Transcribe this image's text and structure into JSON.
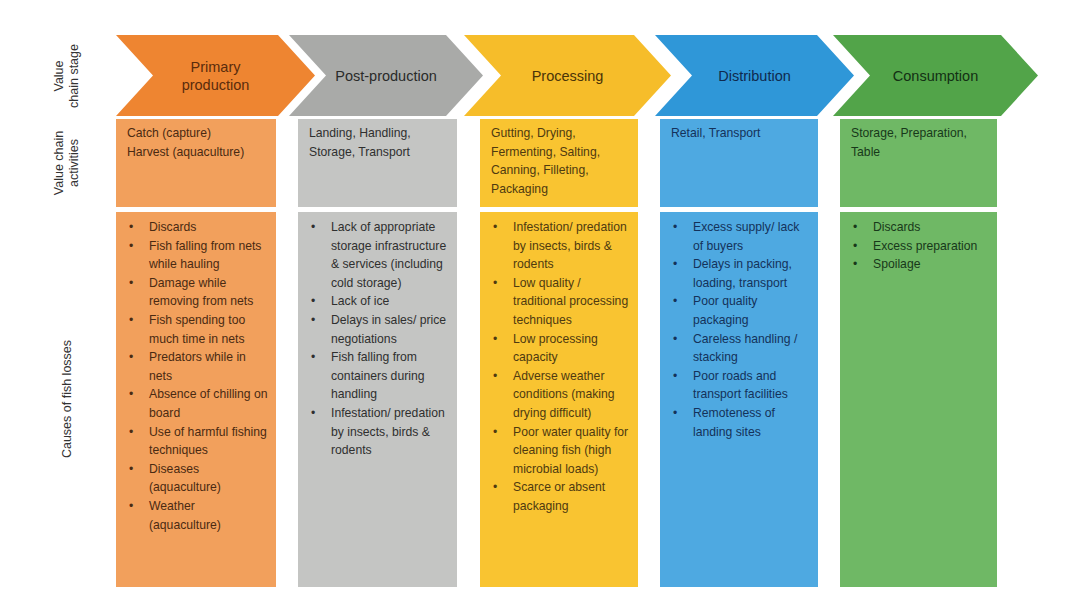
{
  "row_labels": {
    "stage": [
      "Value",
      "chain stage"
    ],
    "activities": [
      "Value chain",
      "activities"
    ],
    "causes": "Causes of fish losses"
  },
  "colors": {
    "primary_production": "#ee8531",
    "post_production": "#a9aaa8",
    "processing": "#f6bd2a",
    "distribution": "#2f97d8",
    "consumption": "#52a449"
  },
  "stages": [
    {
      "name": "Primary production",
      "name_lines": [
        "Primary",
        "production"
      ],
      "activities": [
        "Catch (capture)",
        "Harvest (aquaculture)"
      ],
      "causes": [
        "Discards",
        "Fish falling from nets while hauling",
        "Damage while removing from nets",
        "Fish spending too much time in nets",
        "Predators while in nets",
        "Absence of chilling on board",
        "Use of harmful fishing techniques",
        "Diseases (aquaculture)",
        "Weather (aquaculture)"
      ]
    },
    {
      "name": "Post-production",
      "name_lines": [
        "Post-production"
      ],
      "activities": [
        "Landing, Handling, Storage, Transport"
      ],
      "causes": [
        "Lack of appropriate storage infrastructure & services (including cold storage)",
        "Lack of ice",
        "Delays in sales/ price negotiations",
        "Fish falling from containers during handling",
        "Infestation/ predation by insects, birds & rodents"
      ]
    },
    {
      "name": "Processing",
      "name_lines": [
        "Processing"
      ],
      "activities": [
        "Gutting, Drying, Fermenting, Salting, Canning, Filleting, Packaging"
      ],
      "causes": [
        "Infestation/ predation by insects, birds & rodents",
        "Low quality / traditional processing techniques",
        "Low processing capacity",
        "Adverse weather conditions (making drying difficult)",
        "Poor water quality for cleaning fish (high microbial loads)",
        "Scarce or absent packaging"
      ]
    },
    {
      "name": "Distribution",
      "name_lines": [
        "Distribution"
      ],
      "activities": [
        "Retail, Transport"
      ],
      "causes": [
        "Excess supply/ lack of buyers",
        "Delays in packing, loading, transport",
        "Poor quality packaging",
        "Careless handling / stacking",
        "Poor roads and transport facilities",
        "Remoteness of landing sites"
      ]
    },
    {
      "name": "Consumption",
      "name_lines": [
        "Consumption"
      ],
      "activities": [
        "Storage, Preparation, Table"
      ],
      "causes": [
        "Discards",
        "Excess preparation",
        "Spoilage"
      ]
    }
  ]
}
